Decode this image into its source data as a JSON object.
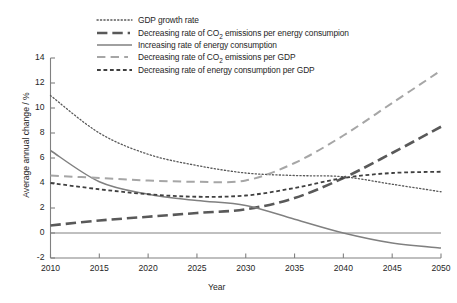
{
  "chart_data": {
    "type": "line",
    "title": "",
    "xlabel": "Year",
    "ylabel": "Average annual change / %",
    "xlim": [
      2010,
      2050
    ],
    "ylim": [
      -2,
      14
    ],
    "yticks": [
      "14",
      "12",
      "10",
      "8",
      "6",
      "4",
      "2",
      "0",
      "-2"
    ],
    "ytick_values": [
      14,
      12,
      10,
      8,
      6,
      4,
      2,
      0,
      -2
    ],
    "xticks": [
      "2010",
      "2015",
      "2020",
      "2025",
      "2030",
      "2035",
      "2040",
      "2045",
      "2050"
    ],
    "xtick_values": [
      2010,
      2015,
      2020,
      2025,
      2030,
      2035,
      2040,
      2045,
      2050
    ],
    "grid": false,
    "legend_position": "top-center",
    "x": [
      2010,
      2015,
      2020,
      2025,
      2030,
      2035,
      2040,
      2045,
      2050
    ],
    "series": [
      {
        "name": "GDP growth rate",
        "style": "dotted",
        "color": "#595959",
        "width": 1.3,
        "values": [
          11.0,
          8.0,
          6.3,
          5.4,
          4.8,
          4.6,
          4.5,
          3.9,
          3.3
        ]
      },
      {
        "name": "Decreasing rate of CO2 emissions per energy consumpion",
        "label_html": "Decreasing rate of CO<sub>2</sub> emissions per energy consumpion",
        "style": "long-dash",
        "color": "#595959",
        "width": 2.6,
        "values": [
          0.6,
          1.0,
          1.3,
          1.6,
          1.9,
          2.8,
          4.4,
          6.4,
          8.5
        ]
      },
      {
        "name": "Increasing rate of energy consumption",
        "style": "solid",
        "color": "#808080",
        "width": 1.5,
        "values": [
          6.6,
          4.1,
          3.1,
          2.6,
          2.2,
          1.1,
          0.0,
          -0.8,
          -1.2
        ]
      },
      {
        "name": "Decreasing rate of CO2 emissions per GDP",
        "label_html": "Decreasing rate of CO<sub>2</sub> emissions per GDP",
        "style": "medium-dash",
        "color": "#a6a6a6",
        "width": 2.0,
        "values": [
          4.6,
          4.4,
          4.2,
          4.1,
          4.2,
          5.6,
          7.8,
          10.4,
          13.0
        ]
      },
      {
        "name": "Decreasing rate of energy consumption per GDP",
        "style": "short-dash",
        "color": "#404040",
        "width": 1.8,
        "values": [
          4.0,
          3.5,
          3.1,
          2.9,
          3.0,
          3.6,
          4.4,
          4.8,
          4.9
        ]
      }
    ]
  },
  "legend": {
    "items": [
      {
        "label": "GDP growth rate",
        "swatch": "dotted-line-swatch"
      },
      {
        "label": "Decreasing rate of CO2 emissions per energy consumpion",
        "swatch": "long-dash-line-swatch"
      },
      {
        "label": "Increasing rate of energy consumption",
        "swatch": "solid-line-swatch"
      },
      {
        "label": "Decreasing rate of CO2 emissions per GDP",
        "swatch": "medium-dash-line-swatch"
      },
      {
        "label": "Decreasing rate of energy consumption per GDP",
        "swatch": "short-dash-line-swatch"
      }
    ]
  },
  "axes": {
    "y_title": "Average annual change / %",
    "x_title": "Year"
  }
}
